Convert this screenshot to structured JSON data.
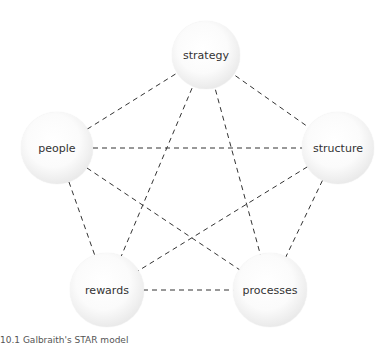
{
  "diagram": {
    "title": "Galbraith's STAR model",
    "nodes": [
      {
        "id": "strategy",
        "label": "strategy",
        "cx": 206,
        "cy": 55,
        "r": 34
      },
      {
        "id": "people",
        "label": "people",
        "cx": 57,
        "cy": 148,
        "r": 36
      },
      {
        "id": "structure",
        "label": "structure",
        "cx": 338,
        "cy": 148,
        "r": 36
      },
      {
        "id": "rewards",
        "label": "rewards",
        "cx": 107,
        "cy": 290,
        "r": 37
      },
      {
        "id": "processes",
        "label": "processes",
        "cx": 270,
        "cy": 290,
        "r": 37
      }
    ],
    "edges": [
      [
        "strategy",
        "people"
      ],
      [
        "strategy",
        "structure"
      ],
      [
        "strategy",
        "rewards"
      ],
      [
        "strategy",
        "processes"
      ],
      [
        "people",
        "structure"
      ],
      [
        "people",
        "rewards"
      ],
      [
        "people",
        "processes"
      ],
      [
        "structure",
        "rewards"
      ],
      [
        "structure",
        "processes"
      ],
      [
        "rewards",
        "processes"
      ]
    ],
    "edge_style": {
      "color": "#333333",
      "dash": "5,4",
      "width": 1
    }
  },
  "caption": "10.1 Galbraith's STAR model"
}
